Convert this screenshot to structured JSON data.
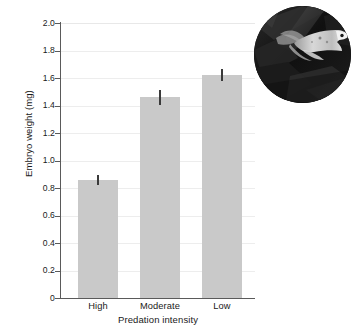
{
  "chart_data": {
    "type": "bar",
    "title": "",
    "subtitle": "",
    "xlabel": "Predation intensity",
    "ylabel": "Embryo weight (mg)",
    "categories": [
      "High",
      "Moderate",
      "Low"
    ],
    "values": [
      0.86,
      1.46,
      1.62
    ],
    "errors": [
      0.035,
      0.055,
      0.045
    ],
    "error_type": "standard error",
    "ylim": [
      0,
      2.0
    ],
    "ytick_labels": [
      "0",
      "0.2",
      "0.4",
      "0.6",
      "0.8",
      "1.0",
      "1.2",
      "1.4",
      "1.6",
      "1.8",
      "2.0"
    ],
    "ytick_values": [
      0,
      0.2,
      0.4,
      0.6,
      0.8,
      1.0,
      1.2,
      1.4,
      1.6,
      1.8,
      2.0
    ],
    "grid": "horizontal",
    "legend": "none",
    "bar_color": "#c9c9c9",
    "error_color": "#3a3a3a",
    "axis_color": "#5a5a5a",
    "grid_color": "#ededed"
  },
  "inset": {
    "name": "fish-photo",
    "description": "Circular grayscale photograph of a guppy fish swimming among dark aquatic vegetation",
    "shape": "circle"
  }
}
